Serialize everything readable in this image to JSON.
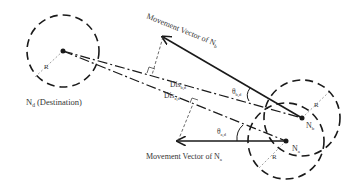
{
  "diagram": {
    "colors": {
      "ink": "#1a1a1a",
      "text": "#333333",
      "light": "#888888",
      "background": "#ffffff"
    },
    "nodes": {
      "destination": {
        "label": "N",
        "sub": "d",
        "suffix": " (Destination)",
        "radius_label": "R"
      },
      "node_b": {
        "label": "N",
        "sub": "b",
        "radius_label": "R"
      },
      "node_a": {
        "label": "N",
        "sub": "a",
        "radius_label": "R"
      }
    },
    "vectors": {
      "b": {
        "text": "Movement Vector of ",
        "node": "N",
        "sub": "b"
      },
      "a": {
        "text": "Movement Vector of ",
        "node": "N",
        "sub": "a"
      }
    },
    "distances": {
      "b": {
        "text": "Dis",
        "sub": "b,d"
      },
      "a": {
        "text": "Dis",
        "sub": "a,d"
      }
    },
    "angles": {
      "b": {
        "text": "θ",
        "sub": "b,d"
      },
      "a": {
        "text": "θ",
        "sub": "a,d"
      }
    }
  }
}
